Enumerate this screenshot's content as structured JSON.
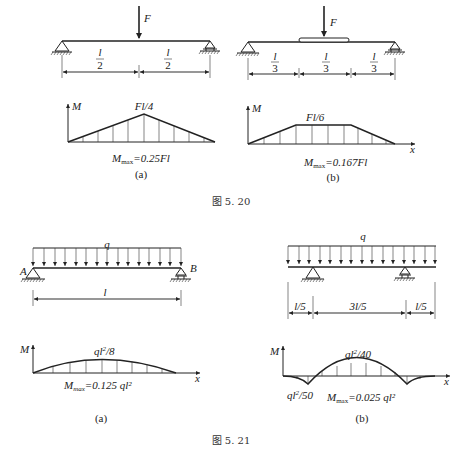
{
  "figure_5_20": {
    "caption": "图 5. 20",
    "a": {
      "load_label": "F",
      "spans": [
        {
          "num": "l",
          "den": "2"
        },
        {
          "num": "l",
          "den": "2"
        }
      ],
      "moment_axis": "M",
      "peak_label": "Fl/4",
      "max_label_M": "M",
      "max_label_sub": "max",
      "max_label_value": "=0.25Fl",
      "sub_caption": "(a)"
    },
    "b": {
      "load_label": "F",
      "spans": [
        {
          "num": "l",
          "den": "3"
        },
        {
          "num": "l",
          "den": "3"
        },
        {
          "num": "l",
          "den": "3"
        }
      ],
      "moment_axis": "M",
      "x_axis": "x",
      "peak_label": "Fl/6",
      "max_label_M": "M",
      "max_label_sub": "max",
      "max_label_value": "=0.167Fl",
      "sub_caption": "(b)"
    }
  },
  "figure_5_21": {
    "caption": "图 5. 21",
    "a": {
      "load_label": "q",
      "support_a": "A",
      "support_b": "B",
      "span_label": "l",
      "moment_axis": "M",
      "x_axis": "x",
      "peak_label": "ql²/8",
      "max_label_M": "M",
      "max_label_sub": "max",
      "max_label_value": "=0.125 ql²",
      "sub_caption": "(a)"
    },
    "b": {
      "load_label": "q",
      "spans": [
        "l/5",
        "3l/5",
        "l/5"
      ],
      "moment_axis": "M",
      "x_axis": "x",
      "peak_label": "ql²/40",
      "support_moment_label": "ql²/50",
      "max_label_M": "M",
      "max_label_sub": "max",
      "max_label_value": "=0.025 ql²",
      "sub_caption": "(b)"
    }
  }
}
